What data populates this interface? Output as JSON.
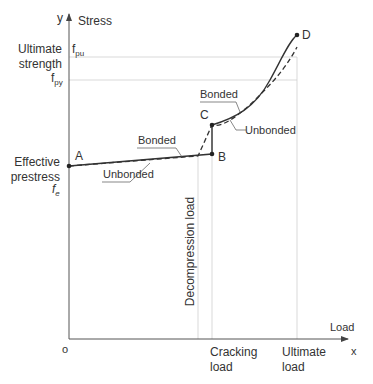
{
  "axes": {
    "y_axis_letter": "y",
    "y_axis_title": "Stress",
    "x_axis_letter": "x",
    "x_axis_title": "Load",
    "origin": "o"
  },
  "y_labels": {
    "ultimate_strength_line1": "Ultimate",
    "ultimate_strength_line2": "strength",
    "fpu_main": "f",
    "fpu_sub": "pu",
    "fpy_main": "f",
    "fpy_sub": "py",
    "effective_line1": "Effective",
    "effective_line2": "prestress",
    "fe_main": "f",
    "fe_sub": "e"
  },
  "x_labels": {
    "cracking_line1": "Cracking",
    "cracking_line2": "load",
    "ultimate_line1": "Ultimate",
    "ultimate_line2": "load",
    "decompression": "Decompression load"
  },
  "points": {
    "A": "A",
    "B": "B",
    "C": "C",
    "D": "D"
  },
  "curve_labels": {
    "bonded_lower": "Bonded",
    "unbonded_lower": "Unbonded",
    "bonded_upper": "Bonded",
    "unbonded_upper": "Unbonded"
  },
  "colors": {
    "axis": "#555555",
    "curve": "#333333",
    "guide": "#cccccc"
  }
}
